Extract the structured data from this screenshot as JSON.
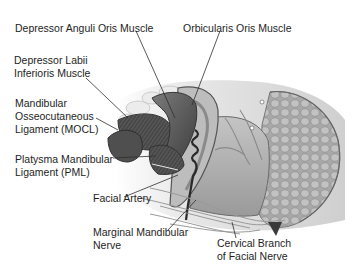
{
  "diagram": {
    "type": "anatomical-illustration",
    "labels": [
      {
        "id": "dao",
        "lines": [
          "Depressor Anguli Oris Muscle"
        ]
      },
      {
        "id": "oo",
        "lines": [
          "Orbicularis Oris Muscle"
        ]
      },
      {
        "id": "dli",
        "lines": [
          "Depressor Labii",
          "Inferioris Muscle"
        ]
      },
      {
        "id": "mocl",
        "lines": [
          "Mandibular",
          "Osseocutaneous",
          "Ligament (MOCL)"
        ]
      },
      {
        "id": "pml",
        "lines": [
          "Platysma Mandibular",
          "Ligament (PML)"
        ]
      },
      {
        "id": "fa",
        "lines": [
          "Facial Artery"
        ]
      },
      {
        "id": "mmn",
        "lines": [
          "Marginal Mandibular",
          "Nerve"
        ]
      },
      {
        "id": "cbfn",
        "lines": [
          "Cervical Branch",
          "of Facial Nerve"
        ]
      }
    ],
    "colors": {
      "line": "#333333",
      "muscle_dark": "#4a4a4a",
      "muscle_mid": "#7a7a7a",
      "tissue_light": "#d8d8d8",
      "gland": "#b8b8b8"
    }
  }
}
